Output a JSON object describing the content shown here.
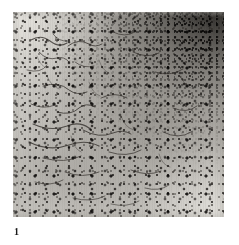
{
  "plate": {
    "background_color": "#ffffff",
    "caption": {
      "figure_number": "1"
    },
    "micrograph": {
      "alt_description": "Grayscale photomicrograph showing dark stained cells and fibrous processes scattered on a pale background, with density increasing steeply toward the upper-right corner",
      "base_tone": "#cfcdc8",
      "dark_tone": "#14120f",
      "light_tone": "#eeece7",
      "density_gradient": {
        "densest_corner": "top-right",
        "sparsest_corner": "top-left"
      }
    }
  }
}
